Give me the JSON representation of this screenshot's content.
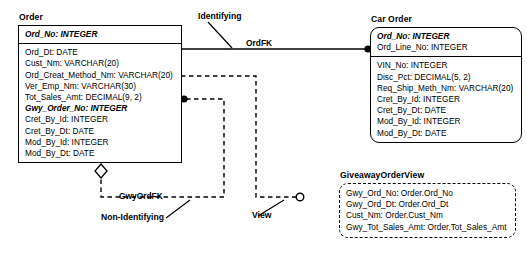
{
  "diagram": {
    "type": "entity-relationship-diagram",
    "background": "#ffffff",
    "line_color": "#000000"
  },
  "entities": [
    {
      "id": "order",
      "title": "Order",
      "style": "rectangular",
      "primary_keys": [
        "Ord_No: INTEGER"
      ],
      "attributes": [
        "Ord_Dt: DATE",
        "Cust_Nm: VARCHAR(20)",
        "Ord_Creat_Method_Nm: VARCHAR(20)",
        "Ver_Emp_Nm: VARCHAR(30)",
        "Tot_Sales_Amt: DECIMAL(9, 2)",
        "Gwy_Order_No: INTEGER",
        "Cret_By_Id: INTEGER",
        "Cret_By_Dt: DATE",
        "Mod_By_Id: INTEGER",
        "Mod_By_Dt: DATE"
      ],
      "foreign_key_attributes": [
        "Gwy_Order_No: INTEGER"
      ]
    },
    {
      "id": "car-order",
      "title": "Car Order",
      "style": "rounded",
      "primary_keys": [
        "Ord_No: INTEGER",
        "Ord_Line_No: INTEGER"
      ],
      "attributes": [
        "VIN_No: INTEGER",
        "Disc_Pct: DECIMAL(5, 2)",
        "Req_Ship_Meth_Nm: VARCHAR(20)",
        "Cret_By_Id: INTEGER",
        "Cret_By_Dt: DATE",
        "Mod_By_Id: INTEGER",
        "Mod_By_Dt: DATE"
      ],
      "foreign_key_attributes": [
        "Ord_No: INTEGER"
      ]
    },
    {
      "id": "giveaway-order-view",
      "title": "GiveawayOrderView",
      "style": "dashed-rounded",
      "primary_keys": [],
      "attributes": [
        "Gwy_Ord_No: Order.Ord_No",
        "Gwy_Ord_Dt: Order.Ord_Dt",
        "Cust_Nm: Order.Cust_Nm",
        "Gwy_Tot_Sales_Amt: Order.Tot_Sales_Amt"
      ]
    }
  ],
  "relationships": [
    {
      "id": "ordfk",
      "name": "OrdFK",
      "kind": "Identifying",
      "line": "solid",
      "from": "order",
      "to": "car-order",
      "child_marker": "filled-dot"
    },
    {
      "id": "gwyordfk",
      "name": "GwyOrdFK",
      "kind": "Non-Identifying",
      "line": "dashed",
      "from": "order",
      "to": "order",
      "parent_marker": "open-diamond"
    },
    {
      "id": "view-rel",
      "name": "View",
      "kind": "View",
      "line": "dashed",
      "from": "order",
      "to": "giveaway-order-view",
      "child_marker": "open-circle"
    }
  ],
  "annotations": [
    {
      "id": "identifying",
      "text": "Identifying"
    },
    {
      "id": "non-identifying",
      "text": "Non-Identifying"
    },
    {
      "id": "view",
      "text": "View"
    }
  ],
  "labels": {
    "ordfk": "OrdFK",
    "gwyordfk": "GwyOrdFK",
    "identifying": "Identifying",
    "non_identifying": "Non-Identifying",
    "view": "View"
  }
}
